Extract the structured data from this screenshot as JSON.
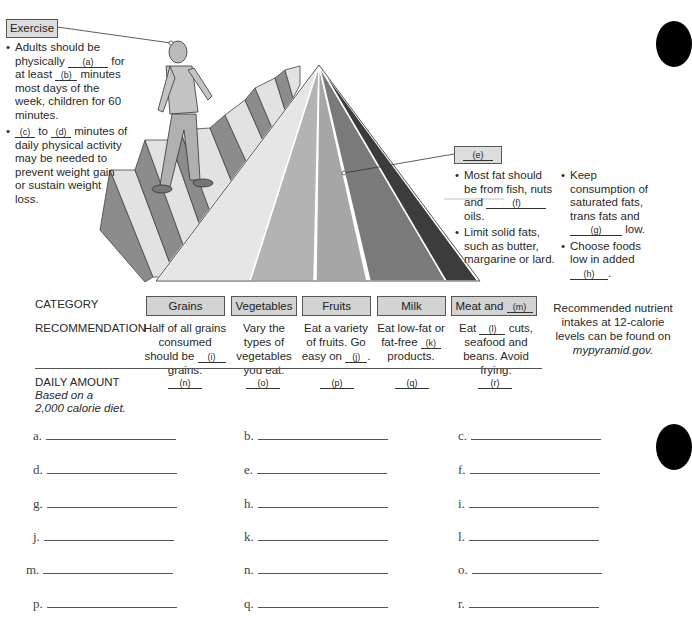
{
  "exercise": {
    "label": "Exercise",
    "bullets": [
      {
        "pre": "Adults should be physically",
        "blank": "(a)",
        "mid": "for at least",
        "blank2": "(b)",
        "post": "minutes most days of the week, children for 60 minutes."
      },
      {
        "blank": "(c)",
        "mid": "to",
        "blank2": "(d)",
        "post": "minutes of daily physical activity may be needed to prevent weight gain or sustain weight loss."
      }
    ]
  },
  "fats": {
    "label": "(e)",
    "col1": [
      {
        "pre": "Most fat should be from fish, nuts and",
        "blank": "(f)",
        "post": "oils."
      },
      {
        "text": "Limit solid fats, such as butter, margarine or lard."
      }
    ],
    "col2": [
      {
        "pre": "Keep consumption of saturated fats, trans fats and",
        "blank": "(g)",
        "post": "low."
      },
      {
        "pre": "Choose foods low in added",
        "blank": "(h)",
        "post": "."
      }
    ]
  },
  "table": {
    "category_label": "CATEGORY",
    "recommendation_label": "RECOMMENDATION",
    "daily_label": "DAILY AMOUNT",
    "daily_sub1": "Based on a",
    "daily_sub2": "2,000 calorie diet.",
    "categories": [
      {
        "name": "Grains",
        "rec_pre": "Half of all grains consumed should be",
        "rec_blank": "(i)",
        "rec_post": "grains.",
        "amount": "(n)"
      },
      {
        "name": "Vegetables",
        "rec_text": "Vary the types of vegetables you eat.",
        "amount": "(o)"
      },
      {
        "name": "Fruits",
        "rec_pre": "Eat a variety of fruits. Go easy on",
        "rec_blank": "(j)",
        "rec_post": ".",
        "amount": "(p)"
      },
      {
        "name": "Milk",
        "rec_pre": "Eat low-fat or fat-free",
        "rec_blank": "(k)",
        "rec_post": "products.",
        "amount": "(q)"
      },
      {
        "name": "Meat and",
        "name_blank": "(m)",
        "rec_pre": "Eat",
        "rec_blank": "(l)",
        "rec_post": "cuts, seafood and beans. Avoid frying.",
        "amount": "(r)"
      }
    ],
    "note_pre": "Recommended nutrient intakes at 12-calorie levels can be found on",
    "note_link": "mypyramid.gov."
  },
  "answers": [
    "a.",
    "b.",
    "c.",
    "d.",
    "e.",
    "f.",
    "g.",
    "h.",
    "i.",
    "j.",
    "k.",
    "l.",
    "m.",
    "n.",
    "o.",
    "p.",
    "q.",
    "r."
  ],
  "colors": {
    "band1": "#e6e6e6",
    "band2": "#b3b3b3",
    "band3": "#a6a6a6",
    "band4": "#7a7a7a",
    "band5": "#5a5a5a",
    "band6": "#3c3c3c",
    "stair_top": "#e2e2e2",
    "stair_riser": "#8c8c8c",
    "box_fill": "#d3d3d3"
  }
}
